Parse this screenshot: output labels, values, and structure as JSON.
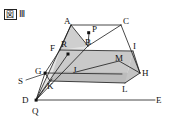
{
  "figure": {
    "boxed_char": "図",
    "numeral": "Ⅲ",
    "caption": "図Ⅲ"
  },
  "diagram": {
    "type": "geometry-solid-with-projection",
    "fill_color": "#c9c9c9",
    "fill_color_dark": "#b4b4b4",
    "stroke_color": "#1a1a1a",
    "background": "#ffffff",
    "vertex_labels": {
      "A": "A",
      "B": "B",
      "C": "C",
      "D": "D",
      "E": "E",
      "F": "F",
      "G": "G",
      "H": "H",
      "I": "I",
      "J": "J",
      "K": "K",
      "L": "L",
      "M": "M",
      "P": "P",
      "Q": "Q",
      "R": "R",
      "S": "S"
    },
    "vertices": [
      {
        "id": "A",
        "label": "A",
        "x": 71,
        "y": 25,
        "lx": 66,
        "ly": 22,
        "dot": false
      },
      {
        "id": "C",
        "label": "C",
        "x": 121,
        "y": 25,
        "lx": 124,
        "ly": 22,
        "dot": false
      },
      {
        "id": "P",
        "label": "P",
        "x": 89,
        "y": 33,
        "lx": 92,
        "ly": 30,
        "dot": true
      },
      {
        "id": "B",
        "label": "B",
        "x": 88,
        "y": 46,
        "lx": 87,
        "ly": 44,
        "dot": false
      },
      {
        "id": "R",
        "label": "R",
        "x": 68,
        "y": 54,
        "lx": 63,
        "ly": 46,
        "dot": true
      },
      {
        "id": "F",
        "label": "F",
        "x": 60,
        "y": 50,
        "lx": 52,
        "ly": 49,
        "dot": false
      },
      {
        "id": "I",
        "label": "I",
        "x": 133,
        "y": 51,
        "lx": 134,
        "ly": 48,
        "dot": false
      },
      {
        "id": "M",
        "label": "M",
        "x": 119,
        "y": 61,
        "lx": 117,
        "ly": 60,
        "dot": false
      },
      {
        "id": "H",
        "label": "H",
        "x": 140,
        "y": 73,
        "lx": 142,
        "ly": 74,
        "dot": false
      },
      {
        "id": "J",
        "label": "J",
        "x": 76,
        "y": 72,
        "lx": 76,
        "ly": 71,
        "dot": false
      },
      {
        "id": "G",
        "label": "G",
        "x": 45,
        "y": 73,
        "lx": 36,
        "ly": 71,
        "dot": true
      },
      {
        "id": "K",
        "label": "K",
        "x": 50,
        "y": 81,
        "lx": 48,
        "ly": 85,
        "dot": false
      },
      {
        "id": "L",
        "label": "L",
        "x": 125,
        "y": 83,
        "lx": 123,
        "ly": 87,
        "dot": false
      },
      {
        "id": "S",
        "label": "S",
        "x": 26,
        "y": 80,
        "lx": 21,
        "ly": 82,
        "dot": false
      },
      {
        "id": "D",
        "label": "D",
        "x": 36,
        "y": 100,
        "lx": 23,
        "ly": 101,
        "dot": false
      },
      {
        "id": "Q",
        "label": "Q",
        "x": 36,
        "y": 100,
        "lx": 33,
        "ly": 112,
        "dot": true
      },
      {
        "id": "E",
        "label": "E",
        "x": 155,
        "y": 100,
        "lx": 157,
        "ly": 101,
        "dot": false
      }
    ],
    "faces": [
      {
        "name": "top-slab-face",
        "points": "60,50 133,51 125,83 50,81",
        "fill": "#c9c9c9"
      },
      {
        "name": "front-band-face",
        "points": "50,81 125,83 140,73 56,71",
        "fill": "#bdbdbd"
      },
      {
        "name": "upper-triangle-face",
        "points": "71,25 88,46 60,50",
        "fill": "#cfcfcf"
      }
    ],
    "edges": [
      {
        "name": "edge-A-C",
        "from": "A",
        "to": "C"
      },
      {
        "name": "edge-A-B",
        "from": "A",
        "to": "B"
      },
      {
        "name": "edge-A-F",
        "from": "A",
        "to": "F"
      },
      {
        "name": "edge-B-C",
        "from": "B",
        "to": "C"
      },
      {
        "name": "edge-P-B",
        "from": "P",
        "to": "B"
      },
      {
        "name": "edge-C-H",
        "from": "C",
        "to": "H"
      },
      {
        "name": "edge-F-I",
        "from": "F",
        "to": "I"
      },
      {
        "name": "edge-F-G",
        "from": "F",
        "to": "G"
      },
      {
        "name": "edge-I-H",
        "from": "I",
        "to": "H"
      },
      {
        "name": "edge-G-L",
        "from": "G",
        "to": "L"
      },
      {
        "name": "edge-J-M",
        "from": "J",
        "to": "M"
      },
      {
        "name": "edge-M-H",
        "from": "M",
        "to": "H"
      },
      {
        "name": "edge-K-L",
        "from": "K",
        "to": "L"
      },
      {
        "name": "edge-L-H",
        "from": "L",
        "to": "H"
      },
      {
        "name": "edge-D-E",
        "from": "D",
        "to": "E"
      },
      {
        "name": "ray-Q-R",
        "from": "Q",
        "to": "R"
      },
      {
        "name": "ray-Q-G",
        "from": "Q",
        "to": "G"
      },
      {
        "name": "ray-Q-K",
        "from": "Q",
        "to": "K"
      },
      {
        "name": "ray-Q-A",
        "from": "Q",
        "to": "A"
      },
      {
        "name": "line-S-G",
        "from": "S",
        "to": "G"
      }
    ]
  }
}
